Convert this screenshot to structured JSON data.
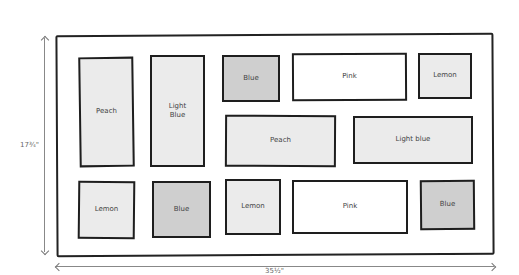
{
  "diagram": {
    "type": "quilt-layout",
    "dimensions": {
      "height_label": "17¾\"",
      "width_label": "35½\""
    },
    "colors": {
      "light_fill": "#ebebeb",
      "dark_fill": "#cfcfcf",
      "white_fill": "#ffffff",
      "outline": "#1e1e1e"
    },
    "blocks": [
      {
        "label": "Peach",
        "fill": "light"
      },
      {
        "label": "Light\nBlue",
        "fill": "light"
      },
      {
        "label": "Blue",
        "fill": "dark"
      },
      {
        "label": "Pink",
        "fill": "white"
      },
      {
        "label": "Lemon",
        "fill": "light"
      },
      {
        "label": "Peach",
        "fill": "light"
      },
      {
        "label": "Light blue",
        "fill": "light"
      },
      {
        "label": "Lemon",
        "fill": "light"
      },
      {
        "label": "Blue",
        "fill": "dark"
      },
      {
        "label": "Lemon",
        "fill": "light"
      },
      {
        "label": "Pink",
        "fill": "white"
      },
      {
        "label": "Blue",
        "fill": "dark"
      }
    ]
  }
}
